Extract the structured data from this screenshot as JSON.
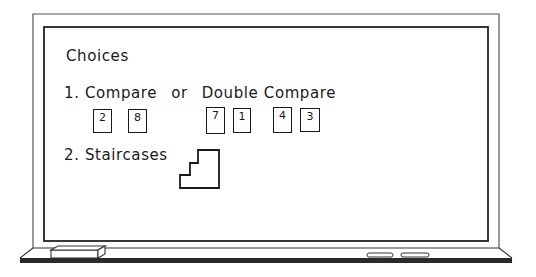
{
  "board": {
    "title": "Choices",
    "item1": {
      "number": "1.",
      "text_a": "Compare",
      "connector": "or",
      "text_b": "Double Compare",
      "cards": [
        {
          "value": "2",
          "group": "compare"
        },
        {
          "value": "8",
          "group": "compare"
        },
        {
          "value": "7",
          "group": "double-compare-pair-1"
        },
        {
          "value": "1",
          "group": "double-compare-pair-1"
        },
        {
          "value": "4",
          "group": "double-compare-pair-2"
        },
        {
          "value": "3",
          "group": "double-compare-pair-2"
        }
      ]
    },
    "item2": {
      "number": "2.",
      "text": "Staircases"
    }
  },
  "tray": {
    "items": [
      "eraser",
      "chalk",
      "chalk"
    ]
  }
}
